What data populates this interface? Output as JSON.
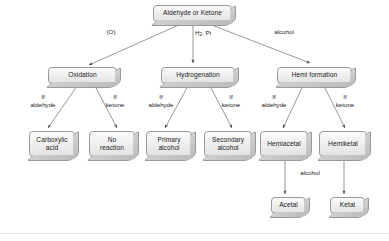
{
  "diagram": {
    "type": "flowchart",
    "theme": {
      "background": "#ffffff",
      "node_fill": "#f0f0f0",
      "node_border": "#9a9a9a",
      "node_shadow": "#bdbdbd",
      "edge_color": "#6b6b6b",
      "text_color": "#1b1b1b"
    },
    "nodes": {
      "root": {
        "label": "Aldehyde or Ketone"
      },
      "oxidation": {
        "label": "Oxidation"
      },
      "hydrogenation": {
        "label": "Hydrogenation"
      },
      "hemi_formation": {
        "label": "Hemi formation"
      },
      "carboxylic_acid": {
        "line1": "Carboxylic",
        "line2": "acid"
      },
      "no_reaction": {
        "line1": "No",
        "line2": "reaction"
      },
      "primary_alcohol": {
        "line1": "Primary",
        "line2": "alcohol"
      },
      "secondary_alcohol": {
        "line1": "Secondary",
        "line2": "alcohol"
      },
      "hemiacetal": {
        "label": "Hemiacetal"
      },
      "hemiketal": {
        "label": "Hemiketal"
      },
      "acetal": {
        "label": "Acetal"
      },
      "ketal": {
        "label": "Ketal"
      }
    },
    "edge_labels": {
      "oxidizer": "(O)",
      "hydrogen_catalyst_pre": "H",
      "hydrogen_catalyst_sub": "2",
      "hydrogen_catalyst_post": ", Pt",
      "alcohol_top": "alcohol",
      "ox_if": "If",
      "ox_aldehyde": "aldehyde",
      "ox_if2": "If",
      "ox_ketone": "ketone",
      "hy_if": "If",
      "hy_aldehyde": "aldehyde",
      "hy_if2": "If",
      "hy_ketone": "ketone",
      "he_if": "If",
      "he_aldehyde": "aldehyde",
      "he_if2": "If",
      "he_ketone": "ketone",
      "alcohol_bottom": "alcohol"
    }
  }
}
